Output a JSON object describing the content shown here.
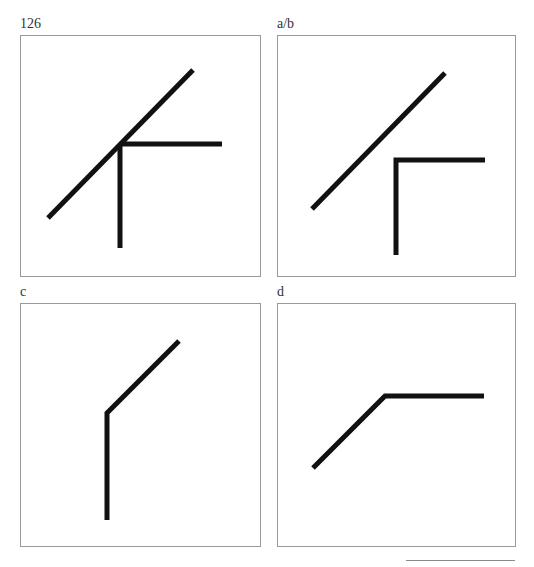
{
  "page": {
    "page_number": "126"
  },
  "figure": {
    "panels": [
      {
        "id": "126",
        "label": "126",
        "box": {
          "x": 20,
          "y": 35,
          "w": 240,
          "h": 241
        },
        "description": "Diagonal line crossed by an L-shaped corner; corner vertex lies on the diagonal",
        "segments": [
          {
            "name": "diagonal-line",
            "points": [
              [
                48,
                218
              ],
              [
                193,
                70
              ]
            ]
          },
          {
            "name": "corner-horizontal-arm",
            "points": [
              [
                120,
                144
              ],
              [
                222,
                144
              ]
            ]
          },
          {
            "name": "corner-vertical-arm",
            "points": [
              [
                120,
                144
              ],
              [
                120,
                248
              ]
            ]
          }
        ]
      },
      {
        "id": "a-b",
        "label": "a/b",
        "box": {
          "x": 277,
          "y": 35,
          "w": 238,
          "h": 241
        },
        "description": "Separated diagonal line and L-shaped corner",
        "segments": [
          {
            "name": "diagonal-line",
            "points": [
              [
                312,
                209
              ],
              [
                445,
                73
              ]
            ]
          },
          {
            "name": "corner",
            "points": [
              [
                485,
                160
              ],
              [
                396,
                160
              ],
              [
                396,
                255
              ]
            ]
          }
        ]
      },
      {
        "id": "c",
        "label": "c",
        "box": {
          "x": 20,
          "y": 303,
          "w": 240,
          "h": 243
        },
        "description": "Vertical line joined to an upward diagonal (bent line)",
        "segments": [
          {
            "name": "bent-line",
            "points": [
              [
                107,
                520
              ],
              [
                107,
                413
              ],
              [
                179,
                341
              ]
            ]
          }
        ]
      },
      {
        "id": "d",
        "label": "d",
        "box": {
          "x": 277,
          "y": 303,
          "w": 238,
          "h": 243
        },
        "description": "Upward diagonal joined to a horizontal line (bent line)",
        "segments": [
          {
            "name": "bent-line",
            "points": [
              [
                313,
                468
              ],
              [
                385,
                396
              ],
              [
                484,
                396
              ]
            ]
          }
        ]
      }
    ],
    "stroke_color": "#111111",
    "border_color": "#9a9a9a"
  }
}
